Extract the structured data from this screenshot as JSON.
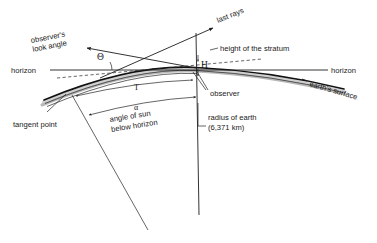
{
  "diagram": {
    "labels": {
      "observers_look_angle": "observer's\nlook angle",
      "observers_look_angle_line1": "observer's",
      "observers_look_angle_line2": "look angle",
      "last_rays": "last rays",
      "height_of_the_stratum": "height of the stratum",
      "horizon_left": "horizon",
      "horizon_right": "horizon",
      "earths_surface": "earth's surface",
      "observer": "observer",
      "tangent_point": "tangent point",
      "angle_of_sun_line1": "angle of sun",
      "angle_of_sun_line2": "below horizon",
      "radius_line1": "radius of earth",
      "radius_line2": "(6,371 km)"
    },
    "symbols": {
      "theta": "Θ",
      "alpha": "α",
      "height_H": "H",
      "tangent_T": "T"
    },
    "values": {
      "earth_radius_km": "6,371 km"
    },
    "colors": {
      "background": "#ffffff",
      "ink": "#1a1a1a",
      "line": "#242424",
      "earth_line": "#111111",
      "earth_band": "#b9b9b9",
      "earth_band_light": "#cfcfcf"
    }
  }
}
